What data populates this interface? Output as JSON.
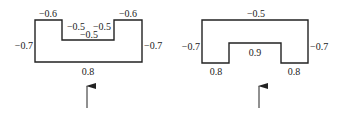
{
  "figures": [
    {
      "name": "left-section",
      "labels": {
        "top_left": "−0.6",
        "top_right": "−0.6",
        "notch_left_wall": "−0.5",
        "notch_right_wall": "−0.5",
        "notch_bottom": "−0.5",
        "left_side": "−0.7",
        "right_side": "−0.7",
        "bottom": "0.8"
      }
    },
    {
      "name": "right-section",
      "labels": {
        "top": "−0.5",
        "left_side": "−0.7",
        "right_side": "−0.7",
        "inner_top": "0.9",
        "bottom_left": "0.8",
        "bottom_right": "0.8"
      }
    }
  ]
}
